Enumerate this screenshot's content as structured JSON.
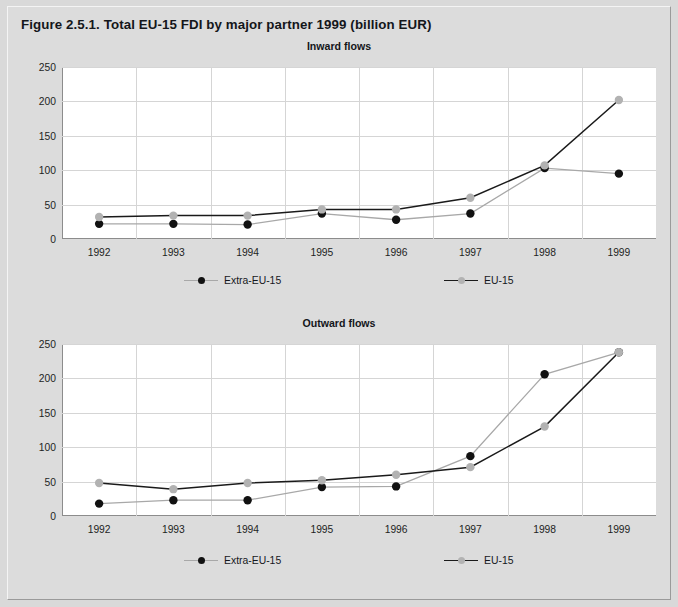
{
  "figure": {
    "title": "Figure 2.5.1. Total EU-15 FDI by major partner 1999 (billion EUR)"
  },
  "colors": {
    "extra_eu_marker": "#111111",
    "extra_eu_line": "#a8a8a8",
    "eu15_marker": "#b2b2b2",
    "eu15_line": "#1a1a1a",
    "plot_background": "#ffffff",
    "panel_background": "#dcdcdc",
    "gridline": "#d5d5d5",
    "axis": "#8c8c8c",
    "text": "#14161a"
  },
  "legend": {
    "extra_eu_label": "Extra-EU-15",
    "eu15_label": "EU-15"
  },
  "chart_data": [
    {
      "type": "line",
      "title": "Inward flows",
      "xlabel": "",
      "ylabel": "",
      "x": [
        "1992",
        "1993",
        "1994",
        "1995",
        "1996",
        "1997",
        "1998",
        "1999"
      ],
      "ylim": [
        0,
        250
      ],
      "yticks": [
        0,
        50,
        100,
        150,
        200,
        250
      ],
      "ytick_labels": [
        "0",
        "50",
        "100",
        "150",
        "200",
        "250"
      ],
      "grid": true,
      "legend_position": "bottom",
      "series": [
        {
          "name": "Extra-EU-15",
          "marker_color": "#111111",
          "line_color": "#a8a8a8",
          "values": [
            22,
            22,
            21,
            37,
            28,
            37,
            103,
            95
          ]
        },
        {
          "name": "EU-15",
          "marker_color": "#b2b2b2",
          "line_color": "#1a1a1a",
          "values": [
            32,
            34,
            34,
            43,
            43,
            60,
            107,
            202
          ]
        }
      ]
    },
    {
      "type": "line",
      "title": "Outward flows",
      "xlabel": "",
      "ylabel": "",
      "x": [
        "1992",
        "1993",
        "1994",
        "1995",
        "1996",
        "1997",
        "1998",
        "1999"
      ],
      "ylim": [
        0,
        250
      ],
      "yticks": [
        0,
        50,
        100,
        150,
        200,
        250
      ],
      "ytick_labels": [
        "0",
        "50",
        "100",
        "150",
        "200",
        "250"
      ],
      "grid": true,
      "legend_position": "bottom",
      "series": [
        {
          "name": "Extra-EU-15",
          "marker_color": "#111111",
          "line_color": "#a8a8a8",
          "values": [
            18,
            23,
            23,
            42,
            43,
            87,
            206,
            238
          ]
        },
        {
          "name": "EU-15",
          "marker_color": "#b2b2b2",
          "line_color": "#1a1a1a",
          "values": [
            48,
            39,
            48,
            52,
            60,
            71,
            130,
            238
          ]
        }
      ]
    }
  ]
}
